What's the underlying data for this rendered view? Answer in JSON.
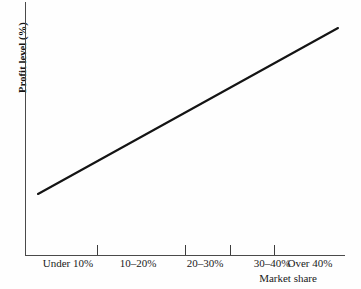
{
  "chart_data": {
    "type": "line",
    "title": "",
    "subtitle": "",
    "xlabel": "Market share",
    "ylabel": "Profit level (%)",
    "categories": [
      "Under 10%",
      "10–20%",
      "20–30%",
      "30–40%",
      "Over 40%"
    ],
    "series": [
      {
        "name": "Profit level",
        "values": [
          12,
          29,
          46,
          63,
          80
        ],
        "color": "#141414"
      }
    ],
    "x": [
      0,
      1,
      2,
      3,
      4
    ],
    "xlim": [
      -0.5,
      4.5
    ],
    "ylim": [
      0,
      100
    ],
    "grid": false,
    "legend": false,
    "legend_position": "none",
    "annotations": [],
    "axis_tick_labels_x": [
      "Under 10%",
      "10–20%",
      "20–30%",
      "30–40%",
      "Over 40%"
    ],
    "axis_tick_labels_y": []
  },
  "axes": {
    "y_title": "Profit level (%)",
    "x_title": "Market share"
  },
  "ticks": {
    "x": [
      {
        "label": "Under 10%",
        "label_px": 68,
        "tick_px": 97
      },
      {
        "label": "10–20%",
        "label_px": 138,
        "tick_px": 185
      },
      {
        "label": "20–30%",
        "label_px": 205,
        "tick_px": 230
      },
      {
        "label": "30–40%",
        "label_px": 272,
        "tick_px": 274
      },
      {
        "label": "Over 40%",
        "label_px": 310,
        "tick_px": 0
      }
    ]
  },
  "colors": {
    "background": "#fefefe",
    "axis": "#4a4a4a",
    "line": "#141414",
    "text": "#1a1a1a"
  }
}
